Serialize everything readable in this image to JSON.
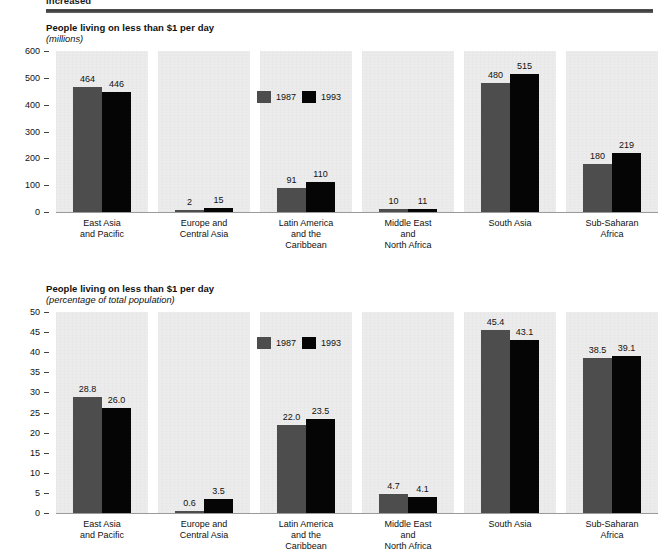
{
  "page": {
    "cut_off_heading": "increased"
  },
  "legend": {
    "items": [
      {
        "label": "1987",
        "color": "#4d4d4d",
        "key": "v1987"
      },
      {
        "label": "1993",
        "color": "#050505",
        "key": "v1993"
      }
    ]
  },
  "chart_data": [
    {
      "id": "millions",
      "type": "bar",
      "title": "People living on less than $1 per day",
      "subtitle": "(millions)",
      "xlabel": "",
      "ylabel": "",
      "ylim": [
        0,
        600
      ],
      "yticks": [
        0,
        100,
        200,
        300,
        400,
        500,
        600
      ],
      "grid": false,
      "legend_position": "inside-panel-3-top",
      "categories": [
        "East Asia\nand Pacific",
        "Europe and\nCentral Asia",
        "Latin America\nand the\nCaribbean",
        "Middle East\nand\nNorth Africa",
        "South Asia",
        "Sub-Saharan\nAfrica"
      ],
      "series": [
        {
          "name": "1987",
          "color": "#4d4d4d",
          "values": [
            464,
            2,
            91,
            10,
            480,
            180
          ]
        },
        {
          "name": "1993",
          "color": "#050505",
          "values": [
            446,
            15,
            110,
            11,
            515,
            219
          ]
        }
      ]
    },
    {
      "id": "percentage",
      "type": "bar",
      "title": "People living on less than $1 per day",
      "subtitle": "(percentage of total population)",
      "xlabel": "",
      "ylabel": "",
      "ylim": [
        0,
        50
      ],
      "yticks": [
        0,
        5,
        10,
        15,
        20,
        25,
        30,
        35,
        40,
        45,
        50
      ],
      "grid": false,
      "legend_position": "inside-panel-3-top",
      "categories": [
        "East Asia\nand Pacific",
        "Europe and\nCentral Asia",
        "Latin America\nand the\nCaribbean",
        "Middle East\nand\nNorth Africa",
        "South Asia",
        "Sub-Saharan\nAfrica"
      ],
      "series": [
        {
          "name": "1987",
          "color": "#4d4d4d",
          "values": [
            28.8,
            0.6,
            22.0,
            4.7,
            45.4,
            38.5
          ]
        },
        {
          "name": "1993",
          "color": "#050505",
          "values": [
            26.0,
            3.5,
            23.5,
            4.1,
            43.1,
            39.1
          ]
        }
      ]
    }
  ]
}
